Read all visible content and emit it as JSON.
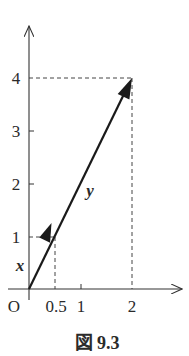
{
  "figure": {
    "caption": "図 9.3",
    "origin_label": "O",
    "axes": {
      "x_ticks": [
        {
          "value": 0.5,
          "label": "0.5"
        },
        {
          "value": 1,
          "label": "1"
        },
        {
          "value": 2,
          "label": "2"
        }
      ],
      "y_ticks": [
        {
          "value": 1,
          "label": "1"
        },
        {
          "value": 2,
          "label": "2"
        },
        {
          "value": 3,
          "label": "3"
        },
        {
          "value": 4,
          "label": "4"
        }
      ]
    },
    "vectors": [
      {
        "name": "x",
        "label": "x",
        "from": [
          0,
          0
        ],
        "to": [
          0.5,
          1
        ]
      },
      {
        "name": "y",
        "label": "y",
        "from": [
          0,
          0
        ],
        "to": [
          2,
          4
        ]
      }
    ],
    "guides": [
      {
        "point": [
          0.5,
          1
        ],
        "style": "dashed"
      },
      {
        "point": [
          2,
          4
        ],
        "style": "dashed"
      }
    ],
    "colors": {
      "axis": "#333333",
      "vector": "#1a1a1a",
      "guide": "#444444",
      "text": "#2a2a2a"
    }
  }
}
